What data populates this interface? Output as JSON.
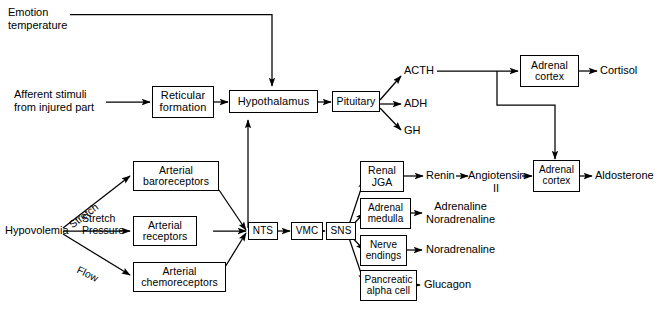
{
  "diagram": {
    "background": "#ffffff",
    "stroke": "#000000",
    "nodes": {
      "reticular_formation": {
        "lines": [
          "Reticular",
          "formation"
        ]
      },
      "hypothalamus": {
        "lines": [
          "Hypothalamus"
        ]
      },
      "pituitary": {
        "lines": [
          "Pituitary"
        ]
      },
      "adrenal_cortex_top": {
        "lines": [
          "Adrenal",
          "cortex"
        ]
      },
      "adrenal_cortex_bottom": {
        "lines": [
          "Adrenal",
          "cortex"
        ]
      },
      "arterial_baroreceptors": {
        "lines": [
          "Arterial",
          "baroreceptors"
        ]
      },
      "arterial_receptors": {
        "lines": [
          "Arterial",
          "receptors"
        ]
      },
      "arterial_chemoreceptors": {
        "lines": [
          "Arterial",
          "chemoreceptors"
        ]
      },
      "nts": {
        "lines": [
          "NTS"
        ]
      },
      "vmc": {
        "lines": [
          "VMC"
        ]
      },
      "sns": {
        "lines": [
          "SNS"
        ]
      },
      "renal_jga": {
        "lines": [
          "Renal",
          "JGA"
        ]
      },
      "adrenal_medulla": {
        "lines": [
          "Adrenal",
          "medulla"
        ]
      },
      "nerve_endings": {
        "lines": [
          "Nerve",
          "endings"
        ]
      },
      "pancreatic_alpha_cell": {
        "lines": [
          "Pancreatic",
          "alpha cell"
        ]
      }
    },
    "labels": {
      "emotion_temperature": [
        "Emotion",
        "temperature"
      ],
      "afferent_stimuli": [
        "Afferent stimuli",
        "from injured part"
      ],
      "hypovolemia": [
        "Hypovolemia"
      ],
      "stretch_upper": [
        "Stretch"
      ],
      "stretch_pressure": [
        "Stretch",
        "Pressure"
      ],
      "flow": [
        "Flow"
      ],
      "acth": [
        "ACTH"
      ],
      "adh": [
        "ADH"
      ],
      "gh": [
        "GH"
      ],
      "cortisol": [
        "Cortisol"
      ],
      "renin": [
        "Renin"
      ],
      "angiotensin_ii": [
        "Angiotensin",
        "II"
      ],
      "aldosterone": [
        "Aldosterone"
      ],
      "adrenaline_noradrenaline": [
        "Adrenaline",
        "Noradrenaline"
      ],
      "noradrenaline": [
        "Noradrenaline"
      ],
      "glucagon": [
        "Glucagon"
      ]
    }
  }
}
